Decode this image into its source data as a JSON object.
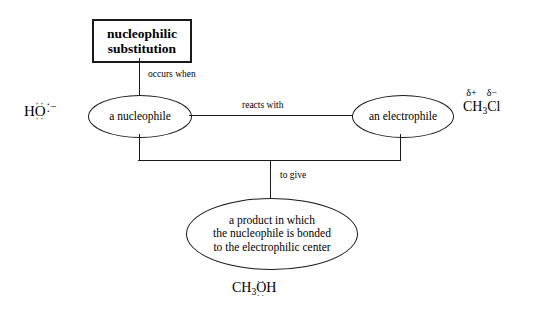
{
  "diagram": {
    "title_box": {
      "line1": "nucleophilic",
      "line2": "substitution"
    },
    "nodes": {
      "nucleophile": "a nucleophile",
      "electrophile": "an electrophile",
      "product": {
        "line1": "a product in which",
        "line2": "the nucleophile is  bonded",
        "line3": "to the electrophilic center"
      }
    },
    "edge_labels": {
      "occurs_when": "occurs when",
      "reacts_with": "reacts with",
      "to_give": "to give"
    },
    "formulas": {
      "hydroxide": {
        "hydrogen": "H",
        "oxygen": "O",
        "lone_pair_top": "··",
        "lone_pair_bottom": "··",
        "lone_pair_right_top": "·",
        "lone_pair_right_bottom": "·",
        "charge": "−"
      },
      "chloromethane": {
        "delta_positive": "δ+",
        "delta_negative": "δ−",
        "carbon": "CH",
        "subscript": "3",
        "chlorine": "Cl"
      },
      "methanol": {
        "methyl": "CH",
        "subscript": "3",
        "oxygen": "O",
        "hydrogen": "H",
        "lone_pair_top": "··",
        "lone_pair_bottom": "··"
      }
    },
    "colors": {
      "ink": "#1a1a1a",
      "background": "#ffffff"
    }
  }
}
